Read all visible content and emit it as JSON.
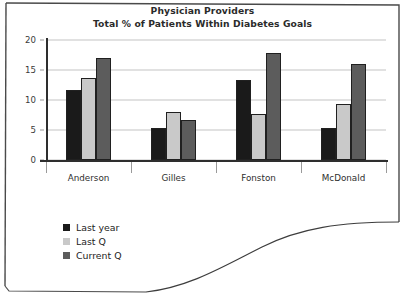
{
  "chart_data": {
    "type": "bar",
    "title": "Physician Providers",
    "subtitle": "Total % of Patients Within Diabetes Goals",
    "xlabel": "",
    "ylabel": "",
    "ylim": [
      0,
      20
    ],
    "yticks": [
      0,
      5,
      10,
      15,
      20
    ],
    "grid": true,
    "legend_position": "bottom-left",
    "categories": [
      "Anderson",
      "Gilles",
      "Fonston",
      "McDonald"
    ],
    "series": [
      {
        "name": "Last year",
        "color": "#1a1a1a",
        "values": [
          11.7,
          5.4,
          13.4,
          5.4
        ]
      },
      {
        "name": "Last Q",
        "color": "#c9c9c9",
        "values": [
          13.7,
          8.0,
          7.7,
          9.3
        ]
      },
      {
        "name": "Current Q",
        "color": "#5c5c5c",
        "values": [
          17.0,
          6.7,
          17.9,
          16.0
        ]
      }
    ]
  }
}
